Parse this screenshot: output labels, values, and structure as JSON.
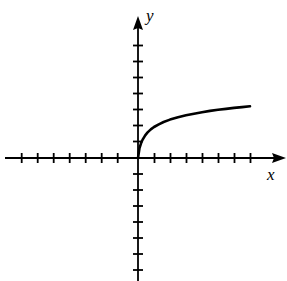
{
  "figure": {
    "width": 287,
    "height": 281,
    "background_color": "#ffffff",
    "stroke_color": "#000000"
  },
  "labels": {
    "x_axis": "x",
    "y_axis": "y"
  },
  "chart_data": {
    "type": "line",
    "title": "",
    "subtitle": "",
    "xlabel": "x",
    "ylabel": "y",
    "grid": false,
    "legend": "none",
    "axes": {
      "origin_px": [
        138,
        158
      ],
      "unit_px": 16,
      "x_axis_pixel_range": [
        5,
        286
      ],
      "y_axis_pixel_range": [
        16,
        281
      ],
      "x_arrow": "right",
      "y_arrow": "up",
      "xlim": [
        -8.3,
        9.3
      ],
      "ylim": [
        -7.7,
        8.9
      ],
      "x_ticks_negative_count": 7,
      "x_ticks_positive_count": 7,
      "y_ticks_positive_count": 7,
      "y_ticks_negative_count": 7,
      "tick_half_length_px": 5,
      "tick_values_x": [
        -7,
        -6,
        -5,
        -4,
        -3,
        -2,
        -1,
        1,
        2,
        3,
        4,
        5,
        6,
        7
      ],
      "tick_values_y": [
        -7,
        -6,
        -5,
        -4,
        -3,
        -2,
        -1,
        1,
        2,
        3,
        4,
        5,
        6,
        7
      ],
      "tick_labels_shown": false
    },
    "series": [
      {
        "name": "curve",
        "description": "increasing concave-down curve starting at the origin",
        "domain": [
          0,
          7.0
        ],
        "x": [
          0.0,
          0.1,
          0.2,
          0.3,
          0.45,
          0.6,
          0.8,
          1.0,
          1.3,
          1.6,
          2.0,
          2.5,
          3.0,
          3.5,
          4.0,
          4.5,
          5.0,
          5.5,
          6.0,
          6.5,
          7.0
        ],
        "y": [
          0.0,
          0.62,
          0.95,
          1.17,
          1.42,
          1.6,
          1.79,
          1.94,
          2.11,
          2.25,
          2.4,
          2.55,
          2.67,
          2.77,
          2.86,
          2.94,
          3.01,
          3.07,
          3.13,
          3.18,
          3.23
        ],
        "points_px": [
          [
            138,
            158
          ],
          [
            139.5,
            148
          ],
          [
            141.2,
            142.8
          ],
          [
            142.8,
            139.3
          ],
          [
            145.2,
            135.3
          ],
          [
            147.6,
            132.4
          ],
          [
            150.8,
            129.4
          ],
          [
            154.0,
            127.0
          ],
          [
            158.8,
            124.3
          ],
          [
            163.6,
            122.0
          ],
          [
            170.0,
            119.6
          ],
          [
            178.0,
            117.2
          ],
          [
            186.0,
            115.3
          ],
          [
            194.0,
            113.7
          ],
          [
            202.0,
            112.2
          ],
          [
            210.0,
            110.9
          ],
          [
            218.0,
            109.8
          ],
          [
            226.0,
            108.9
          ],
          [
            234.0,
            107.9
          ],
          [
            242.0,
            107.1
          ],
          [
            250.0,
            106.3
          ]
        ],
        "stroke_color": "#000000",
        "stroke_width_px": 2.6
      }
    ]
  }
}
